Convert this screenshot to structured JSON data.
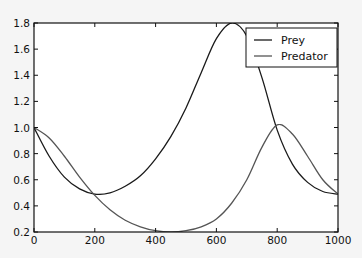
{
  "chart_data": {
    "type": "line",
    "title": "",
    "xlabel": "",
    "ylabel": "",
    "xlim": [
      0,
      1000
    ],
    "ylim": [
      0.2,
      1.8
    ],
    "grid": false,
    "legend_position": "upper right",
    "x_ticks": [
      "0",
      "200",
      "400",
      "600",
      "800",
      "1000"
    ],
    "y_ticks": [
      "0.2",
      "0.4",
      "0.6",
      "0.8",
      "1.0",
      "1.2",
      "1.4",
      "1.6",
      "1.8"
    ],
    "series": [
      {
        "name": "Prey",
        "color": "#1a1a1a",
        "x": [
          0,
          50,
          100,
          150,
          200,
          250,
          300,
          350,
          400,
          450,
          500,
          550,
          600,
          650,
          700,
          750,
          800,
          850,
          900,
          950,
          1000
        ],
        "y": [
          1.0,
          0.78,
          0.62,
          0.53,
          0.49,
          0.5,
          0.55,
          0.63,
          0.76,
          0.93,
          1.15,
          1.42,
          1.68,
          1.8,
          1.7,
          1.38,
          0.98,
          0.72,
          0.58,
          0.51,
          0.49
        ]
      },
      {
        "name": "Predator",
        "color": "#555555",
        "x": [
          0,
          50,
          100,
          150,
          200,
          250,
          300,
          350,
          400,
          450,
          500,
          550,
          600,
          650,
          700,
          750,
          800,
          850,
          900,
          950,
          1000
        ],
        "y": [
          1.0,
          0.92,
          0.78,
          0.62,
          0.48,
          0.37,
          0.29,
          0.24,
          0.21,
          0.2,
          0.21,
          0.24,
          0.3,
          0.42,
          0.6,
          0.85,
          1.02,
          0.95,
          0.78,
          0.6,
          0.49
        ]
      }
    ]
  },
  "legend": {
    "items": [
      {
        "label": "Prey"
      },
      {
        "label": "Predator"
      }
    ]
  }
}
